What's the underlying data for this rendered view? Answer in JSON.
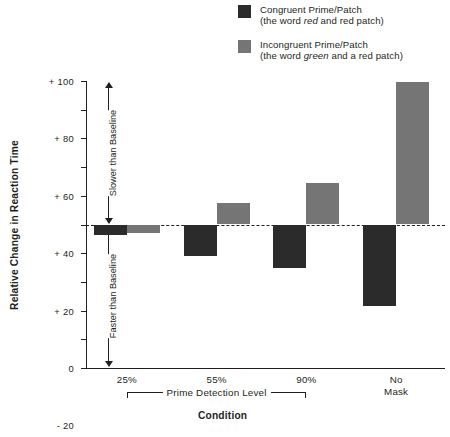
{
  "legend": {
    "entries": [
      {
        "name": "congruent",
        "color": "#2b2b2b",
        "line1": "Congruent Prime/Patch",
        "line2_pre": "(the word ",
        "line2_italic": "red",
        "line2_post": " and red patch)"
      },
      {
        "name": "incongruent",
        "color": "#757575",
        "line1": "Incongruent Prime/Patch",
        "line2_pre": "(the word ",
        "line2_italic": "green",
        "line2_post": " and a red patch)"
      }
    ]
  },
  "annotations": {
    "slower_than_baseline": "Slower than Baseline",
    "faster_than_baseline": "Faster than Baseline",
    "bracket_label": "Prime Detection Level"
  },
  "chart_data": {
    "type": "bar",
    "title": "",
    "xlabel": "Condition",
    "ylabel": "Relative Change in Reaction Time",
    "categories": [
      "25%",
      "55%",
      "90%",
      "No\nMask"
    ],
    "category_lines": [
      [
        "25%"
      ],
      [
        "55%"
      ],
      [
        "90%"
      ],
      [
        "No",
        "Mask"
      ]
    ],
    "series": [
      {
        "name": "Congruent Prime/Patch",
        "color": "#2b2b2b",
        "values": [
          -7,
          -22,
          -30,
          -57
        ]
      },
      {
        "name": "Incongruent Prime/Patch",
        "color": "#757575",
        "values": [
          -6,
          15,
          29,
          99
        ]
      }
    ],
    "ylim": [
      -100,
      100
    ],
    "yticks": [
      100,
      80,
      60,
      40,
      20,
      0,
      -20,
      -40,
      -60,
      -80,
      -100
    ],
    "ytick_labels": [
      "+ 100",
      "+ 80",
      "+ 60",
      "+ 40",
      "+ 20",
      "0",
      "- 20",
      "- 40",
      "- 60",
      "- 80",
      "-100"
    ],
    "grid": false,
    "zero_reference_line": true,
    "legend_position": "top-right"
  }
}
